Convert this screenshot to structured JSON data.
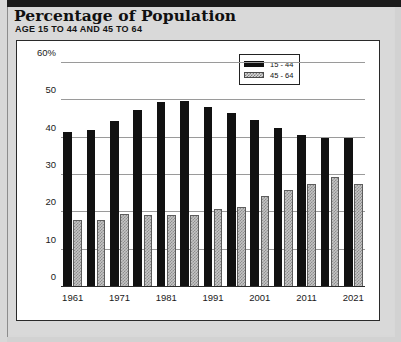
{
  "header": {
    "title": "Percentage of Population",
    "subtitle": "AGE 15 TO 44 AND 45 TO 64"
  },
  "legend": {
    "items": [
      {
        "label": "15 - 44",
        "swatch": "black"
      },
      {
        "label": "45 - 64",
        "swatch": "dotted-gray"
      }
    ]
  },
  "chart_data": {
    "type": "bar",
    "title": "Percentage of Population",
    "subtitle": "AGE 15 TO 44 AND 45 TO 64",
    "xlabel": "",
    "ylabel": "",
    "ylim": [
      0,
      60
    ],
    "yticks": [
      0,
      10,
      20,
      30,
      40,
      50,
      60
    ],
    "ytick_labels": [
      "0",
      "10",
      "20",
      "30",
      "40",
      "50",
      "60%"
    ],
    "grid": true,
    "legend_position": "top-right",
    "categories": [
      "1961",
      "1966",
      "1971",
      "1976",
      "1981",
      "1986",
      "1991",
      "1996",
      "2001",
      "2006",
      "2011",
      "2016",
      "2021"
    ],
    "xtick_labels": [
      "1961",
      "1971",
      "1981",
      "1991",
      "2001",
      "2011",
      "2021"
    ],
    "series": [
      {
        "name": "15 - 44",
        "color": "#111111",
        "values": [
          41.5,
          42.0,
          44.5,
          47.5,
          49.5,
          49.7,
          48.3,
          46.7,
          44.7,
          42.7,
          40.7,
          39.8,
          39.8
        ]
      },
      {
        "name": "45 - 64",
        "color": "#c4c4c4",
        "values": [
          18.0,
          18.0,
          19.5,
          19.3,
          19.3,
          19.3,
          20.8,
          21.3,
          24.3,
          26.0,
          27.7,
          29.5,
          27.7
        ]
      }
    ]
  }
}
